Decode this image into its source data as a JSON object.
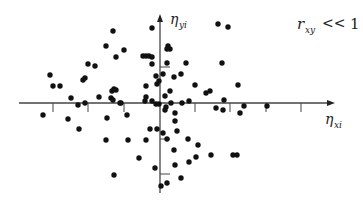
{
  "chart_data": {
    "type": "scatter",
    "title": "",
    "annotation": "r_xy << 1",
    "annotation_parts": {
      "symbol": "r",
      "subscript": "xy",
      "relation": "<<",
      "value": "1"
    },
    "xlabel": "η_xi",
    "ylabel": "η_yi",
    "xlabel_parts": {
      "symbol": "η",
      "subscript": "xi"
    },
    "ylabel_parts": {
      "symbol": "η",
      "subscript": "yi"
    },
    "grid": false,
    "legend": "none",
    "axes": {
      "origin_px": [
        160,
        103
      ],
      "x_axis_px": [
        19,
        335
      ],
      "y_axis_px": [
        193,
        14
      ],
      "x_ticks_px": [
        53,
        88,
        124,
        195,
        230,
        266,
        301
      ],
      "y_ticks_px": [
        67,
        139,
        174
      ]
    },
    "points_px": [
      [
        113,
        31
      ],
      [
        152,
        28
      ],
      [
        168,
        46
      ],
      [
        170,
        49
      ],
      [
        106,
        46
      ],
      [
        124,
        50
      ],
      [
        116,
        57
      ],
      [
        143,
        56
      ],
      [
        146,
        56
      ],
      [
        149,
        56
      ],
      [
        152,
        57
      ],
      [
        167,
        49
      ],
      [
        218,
        24
      ],
      [
        228,
        27
      ],
      [
        167,
        63
      ],
      [
        186,
        63
      ],
      [
        222,
        63
      ],
      [
        152,
        64
      ],
      [
        88,
        64
      ],
      [
        95,
        66
      ],
      [
        83,
        80
      ],
      [
        163,
        74
      ],
      [
        181,
        74
      ],
      [
        156,
        76
      ],
      [
        174,
        77
      ],
      [
        50,
        75
      ],
      [
        85,
        78
      ],
      [
        195,
        85
      ],
      [
        53,
        86
      ],
      [
        60,
        86
      ],
      [
        146,
        86
      ],
      [
        157,
        84
      ],
      [
        159,
        81
      ],
      [
        114,
        89
      ],
      [
        116,
        90
      ],
      [
        112,
        91
      ],
      [
        165,
        96
      ],
      [
        170,
        91
      ],
      [
        238,
        85
      ],
      [
        210,
        91
      ],
      [
        224,
        100
      ],
      [
        206,
        93
      ],
      [
        71,
        98
      ],
      [
        99,
        97
      ],
      [
        111,
        98
      ],
      [
        113,
        100
      ],
      [
        146,
        97
      ],
      [
        159,
        104
      ],
      [
        182,
        103
      ],
      [
        145,
        101
      ],
      [
        152,
        101
      ],
      [
        156,
        104
      ],
      [
        171,
        103
      ],
      [
        189,
        101
      ],
      [
        175,
        113
      ],
      [
        166,
        107
      ],
      [
        165,
        110
      ],
      [
        121,
        103
      ],
      [
        78,
        105
      ],
      [
        85,
        103
      ],
      [
        120,
        103
      ],
      [
        43,
        115
      ],
      [
        68,
        119
      ],
      [
        79,
        129
      ],
      [
        107,
        118
      ],
      [
        127,
        115
      ],
      [
        150,
        129
      ],
      [
        157,
        129
      ],
      [
        163,
        133
      ],
      [
        216,
        108
      ],
      [
        223,
        110
      ],
      [
        244,
        106
      ],
      [
        240,
        113
      ],
      [
        267,
        106
      ],
      [
        167,
        139
      ],
      [
        175,
        121
      ],
      [
        177,
        131
      ],
      [
        188,
        139
      ],
      [
        198,
        145
      ],
      [
        189,
        162
      ],
      [
        196,
        157
      ],
      [
        106,
        140
      ],
      [
        128,
        140
      ],
      [
        146,
        140
      ],
      [
        139,
        158
      ],
      [
        174,
        150
      ],
      [
        175,
        165
      ],
      [
        181,
        178
      ],
      [
        155,
        168
      ],
      [
        167,
        183
      ],
      [
        114,
        175
      ],
      [
        161,
        186
      ],
      [
        233,
        155
      ],
      [
        237,
        155
      ],
      [
        211,
        155
      ]
    ],
    "colors": {
      "points": "#111111",
      "axes": "#444444",
      "background": "#ffffff"
    }
  }
}
